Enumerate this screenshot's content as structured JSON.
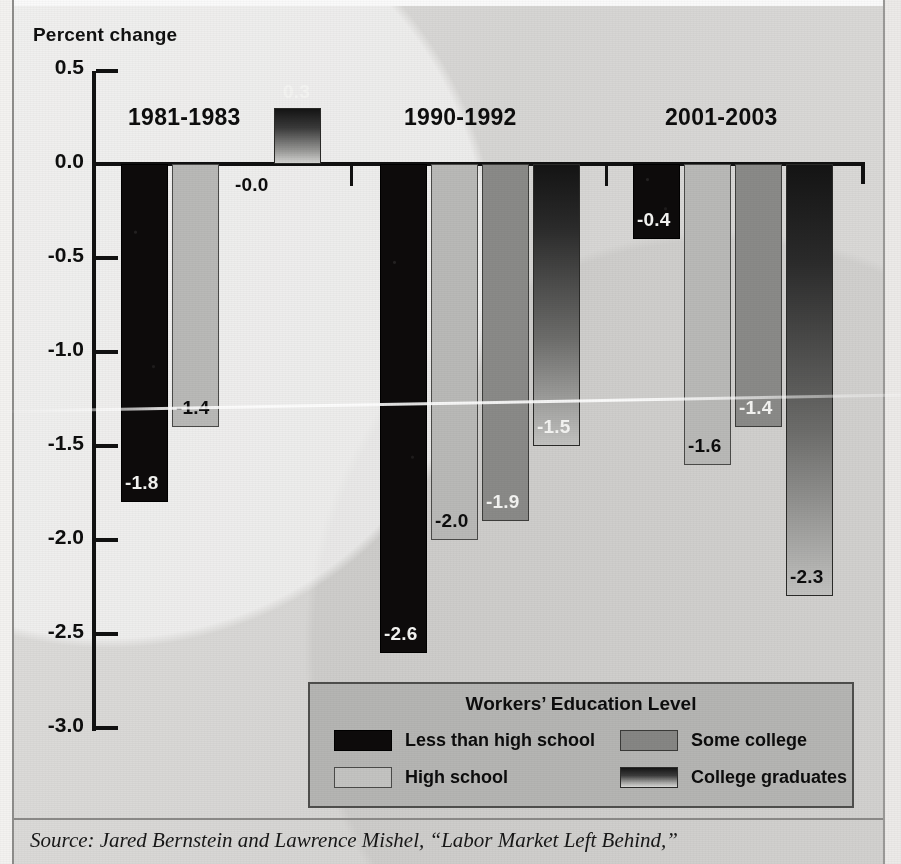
{
  "axis_title": "Percent change",
  "source_note": "Source: Jared Bernstein and Lawrence Mishel, “Labor Market Left Behind,”",
  "legend": {
    "title": "Workers’ Education Level",
    "items": [
      {
        "label": "Less than high school",
        "swatch": "black-swatch"
      },
      {
        "label": "High school",
        "swatch": "light-gray-swatch"
      },
      {
        "label": "Some college",
        "swatch": "medium-gray-swatch"
      },
      {
        "label": "College graduates",
        "swatch": "gradient-swatch"
      }
    ]
  },
  "colors": {
    "less_than_high_school": "#0d0b0b",
    "high_school": "#b9b9b7",
    "some_college": "#8a8a88",
    "college_graduates": "#6d6d6b",
    "page_background": "#d9d9d7",
    "legend_background": "#b5b5b3",
    "axis": "#111111"
  },
  "chart_data": {
    "type": "bar",
    "title": "",
    "xlabel": "",
    "ylabel": "Percent change",
    "ylim": [
      -3.0,
      0.5
    ],
    "yticks": [
      "0.5",
      "0.0",
      "-0.5",
      "-1.0",
      "-1.5",
      "-2.0",
      "-2.5",
      "-3.0"
    ],
    "ytick_values": [
      0.5,
      0.0,
      -0.5,
      -1.0,
      -1.5,
      -2.0,
      -2.5,
      -3.0
    ],
    "grid": false,
    "legend_position": "bottom-right",
    "categories": [
      "1981-1983",
      "1990-1992",
      "2001-2003"
    ],
    "series": [
      {
        "name": "Less than high school",
        "values": [
          -1.8,
          -2.6,
          -0.4
        ],
        "labels": [
          "-1.8",
          "-2.6",
          "-0.4"
        ]
      },
      {
        "name": "High school",
        "values": [
          -1.4,
          -2.0,
          -1.6
        ],
        "labels": [
          "-1.4",
          "-2.0",
          "-1.6"
        ]
      },
      {
        "name": "Some college",
        "values": [
          -0.0,
          -1.9,
          -1.4
        ],
        "labels": [
          "-0.0",
          "-1.9",
          "-1.4"
        ]
      },
      {
        "name": "College graduates",
        "values": [
          0.3,
          -1.5,
          -2.3
        ],
        "labels": [
          "0.3",
          "-1.5",
          "-2.3"
        ]
      }
    ]
  }
}
